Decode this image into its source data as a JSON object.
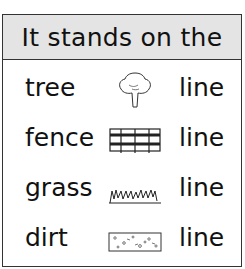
{
  "header": {
    "title": "It stands on the"
  },
  "rows": [
    {
      "word": "tree",
      "icon": "tree-icon",
      "suffix": "line"
    },
    {
      "word": "fence",
      "icon": "fence-icon",
      "suffix": "line"
    },
    {
      "word": "grass",
      "icon": "grass-icon",
      "suffix": "line"
    },
    {
      "word": "dirt",
      "icon": "dirt-icon",
      "suffix": "line"
    }
  ]
}
